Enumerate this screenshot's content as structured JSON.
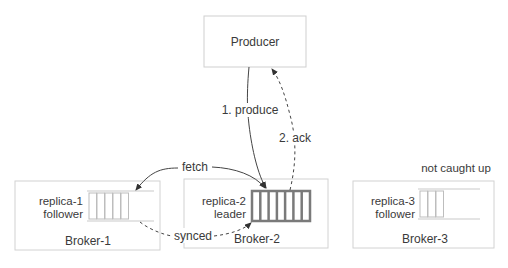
{
  "producer": {
    "label": "Producer"
  },
  "arrows": {
    "produce": "1. produce",
    "ack": "2. ack",
    "fetch": "fetch",
    "synced": "synced",
    "not_caught_up": "not caught up"
  },
  "brokers": [
    {
      "name": "Broker-1",
      "replica": "replica-1",
      "role": "follower",
      "cells": 5
    },
    {
      "name": "Broker-2",
      "replica": "replica-2",
      "role": "leader",
      "cells": 7
    },
    {
      "name": "Broker-3",
      "replica": "replica-3",
      "role": "follower",
      "cells": 3
    }
  ],
  "colors": {
    "box_border": "#cfcfcf",
    "leader_log": "#7a7a7a",
    "follower_log": "#bdbdbd",
    "arrow": "#444444",
    "text": "#3a3a3a"
  }
}
